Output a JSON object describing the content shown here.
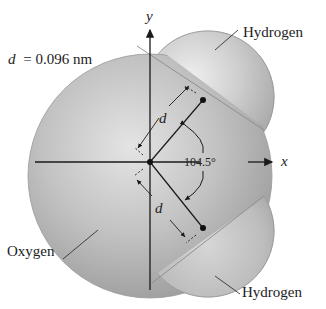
{
  "figure": {
    "distance_label": "d = 0.096 nm",
    "distance_symbol": "d",
    "distance_value": "= 0.096 nm",
    "angle_label": "104.5°",
    "axes": {
      "x": "x",
      "y": "y"
    },
    "atoms": [
      {
        "name": "Oxygen",
        "label": "Oxygen"
      },
      {
        "name": "Hydrogen",
        "label": "Hydrogen",
        "position": "upper"
      },
      {
        "name": "Hydrogen",
        "label": "Hydrogen",
        "position": "lower"
      }
    ],
    "bond_labels": [
      "d",
      "d"
    ],
    "colors": {
      "oxygen_fill": "#b8b8b8",
      "hydrogen_fill": "#c4c4c4",
      "line": "#1a1a1a",
      "background": "#ffffff"
    }
  }
}
